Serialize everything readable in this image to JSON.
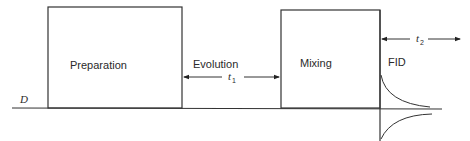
{
  "diagram": {
    "baseline_label": "D",
    "blocks": [
      {
        "label": "Preparation"
      },
      {
        "label": "Mixing"
      }
    ],
    "evolution": {
      "label": "Evolution",
      "time_symbol": "t",
      "time_subscript": "1"
    },
    "detection": {
      "label": "FID",
      "time_symbol": "t",
      "time_subscript": "2"
    }
  }
}
